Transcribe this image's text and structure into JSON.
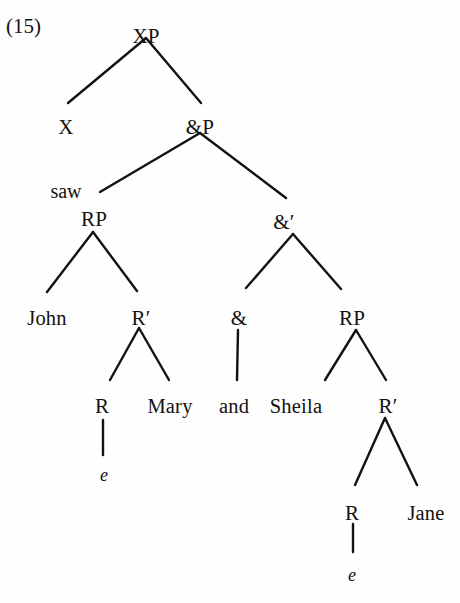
{
  "figure": {
    "example_number": "(15)",
    "type": "syntax-tree",
    "ink_color": "#15110f",
    "background_color": "#fefefe"
  },
  "annotations": [
    {
      "id": "saw-label",
      "text": "saw",
      "x": 66,
      "y": 181
    }
  ],
  "nodes": [
    {
      "id": "xp",
      "label": "XP",
      "x": 146,
      "y": 26,
      "kind": "category"
    },
    {
      "id": "x",
      "label": "X",
      "x": 66,
      "y": 117,
      "kind": "category"
    },
    {
      "id": "andp",
      "label": "&P",
      "x": 200,
      "y": 117,
      "kind": "category"
    },
    {
      "id": "rp-left",
      "label": "RP",
      "x": 94,
      "y": 209,
      "kind": "category"
    },
    {
      "id": "andbar",
      "label": "&′",
      "x": 284,
      "y": 212,
      "kind": "category"
    },
    {
      "id": "john",
      "label": "John",
      "x": 47,
      "y": 308,
      "kind": "lexical"
    },
    {
      "id": "rbar-left",
      "label": "R′",
      "x": 141,
      "y": 308,
      "kind": "category"
    },
    {
      "id": "and-head",
      "label": "&",
      "x": 239,
      "y": 308,
      "kind": "category"
    },
    {
      "id": "rp-right",
      "label": "RP",
      "x": 352,
      "y": 308,
      "kind": "category"
    },
    {
      "id": "r-left",
      "label": "R",
      "x": 102,
      "y": 396,
      "kind": "category"
    },
    {
      "id": "mary",
      "label": "Mary",
      "x": 170,
      "y": 396,
      "kind": "lexical"
    },
    {
      "id": "and-word",
      "label": "and",
      "x": 234,
      "y": 396,
      "kind": "lexical"
    },
    {
      "id": "sheila",
      "label": "Sheila",
      "x": 296,
      "y": 396,
      "kind": "lexical"
    },
    {
      "id": "rbar-right",
      "label": "R′",
      "x": 388,
      "y": 396,
      "kind": "category"
    },
    {
      "id": "e-left",
      "label": "e",
      "x": 104,
      "y": 466,
      "kind": "trace"
    },
    {
      "id": "r-right",
      "label": "R",
      "x": 352,
      "y": 503,
      "kind": "category"
    },
    {
      "id": "jane",
      "label": "Jane",
      "x": 426,
      "y": 503,
      "kind": "lexical"
    },
    {
      "id": "e-right",
      "label": "e",
      "x": 352,
      "y": 566,
      "kind": "trace"
    }
  ],
  "edges": [
    {
      "from": "xp",
      "to": "x",
      "x1": 146,
      "y1": 38,
      "x2": 68,
      "y2": 103
    },
    {
      "from": "xp",
      "to": "andp",
      "x1": 146,
      "y1": 38,
      "x2": 201,
      "y2": 103
    },
    {
      "from": "andp",
      "to": "rp-left",
      "x1": 200,
      "y1": 133,
      "x2": 100,
      "y2": 192
    },
    {
      "from": "andp",
      "to": "andbar",
      "x1": 200,
      "y1": 133,
      "x2": 286,
      "y2": 198
    },
    {
      "from": "rp-left",
      "to": "john",
      "x1": 93,
      "y1": 232,
      "x2": 47,
      "y2": 292
    },
    {
      "from": "rp-left",
      "to": "rbar-left",
      "x1": 93,
      "y1": 232,
      "x2": 137,
      "y2": 291
    },
    {
      "from": "andbar",
      "to": "and-head",
      "x1": 293,
      "y1": 234,
      "x2": 246,
      "y2": 288
    },
    {
      "from": "andbar",
      "to": "rp-right",
      "x1": 293,
      "y1": 234,
      "x2": 341,
      "y2": 289
    },
    {
      "from": "rbar-left",
      "to": "r-left",
      "x1": 139,
      "y1": 328,
      "x2": 110,
      "y2": 380
    },
    {
      "from": "rbar-left",
      "to": "mary",
      "x1": 139,
      "y1": 328,
      "x2": 169,
      "y2": 380
    },
    {
      "from": "and-head",
      "to": "and-word",
      "x1": 238,
      "y1": 330,
      "x2": 237,
      "y2": 380
    },
    {
      "from": "rp-right",
      "to": "sheila",
      "x1": 356,
      "y1": 330,
      "x2": 325,
      "y2": 380
    },
    {
      "from": "rp-right",
      "to": "rbar-right",
      "x1": 356,
      "y1": 330,
      "x2": 386,
      "y2": 380
    },
    {
      "from": "r-left",
      "to": "e-left",
      "x1": 103,
      "y1": 420,
      "x2": 103,
      "y2": 455
    },
    {
      "from": "rbar-right",
      "to": "r-right",
      "x1": 385,
      "y1": 418,
      "x2": 355,
      "y2": 485
    },
    {
      "from": "rbar-right",
      "to": "jane",
      "x1": 385,
      "y1": 418,
      "x2": 417,
      "y2": 485
    },
    {
      "from": "r-right",
      "to": "e-right",
      "x1": 353,
      "y1": 524,
      "x2": 353,
      "y2": 552
    }
  ]
}
